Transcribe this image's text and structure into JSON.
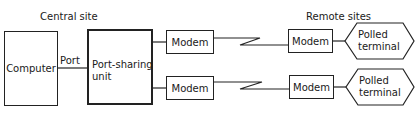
{
  "diagram": {
    "sections": {
      "central": "Central site",
      "remote": "Remote sites"
    },
    "nodes": {
      "computer": "Computer",
      "port_label": "Port",
      "port_sharing_line1": "Port-sharing",
      "port_sharing_line2": "unit",
      "modem_central_1": "Modem",
      "modem_central_2": "Modem",
      "modem_remote_1": "Modem",
      "modem_remote_2": "Modem",
      "terminal_1_line1": "Polled",
      "terminal_1_line2": "terminal",
      "terminal_2_line1": "Polled",
      "terminal_2_line2": "terminal"
    },
    "edges": [
      {
        "from": "Computer",
        "to": "Port-sharing unit",
        "label": "Port"
      },
      {
        "from": "Port-sharing unit",
        "to": "Modem (central 1)"
      },
      {
        "from": "Port-sharing unit",
        "to": "Modem (central 2)"
      },
      {
        "from": "Modem (central 1)",
        "to": "Modem (remote 1)",
        "type": "communication link"
      },
      {
        "from": "Modem (central 2)",
        "to": "Modem (remote 2)",
        "type": "communication link"
      },
      {
        "from": "Modem (remote 1)",
        "to": "Polled terminal 1"
      },
      {
        "from": "Modem (remote 2)",
        "to": "Polled terminal 2"
      }
    ]
  }
}
